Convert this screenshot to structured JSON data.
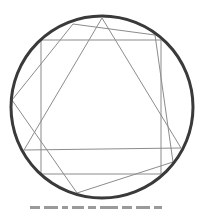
{
  "diagram": {
    "colors": {
      "background": "#ffffff",
      "circle_stroke": "#3a3a3a",
      "line_stroke": "#8c8c8c"
    },
    "circle": {
      "cx": 102,
      "cy": 107,
      "r": 91,
      "stroke_width": 3
    },
    "square": {
      "x": 41,
      "y": 40,
      "width": 120,
      "height": 134
    },
    "triangle": {
      "points": "102,18 24,150 181,148"
    },
    "quadrilateral": {
      "points": "12,100 73,24 155,35 173,162 77,193"
    }
  },
  "caption": {
    "visible": "partially cut off (unreadable)",
    "fragments": [
      10,
      14,
      6,
      12,
      8,
      18,
      10,
      14,
      8,
      12
    ]
  }
}
